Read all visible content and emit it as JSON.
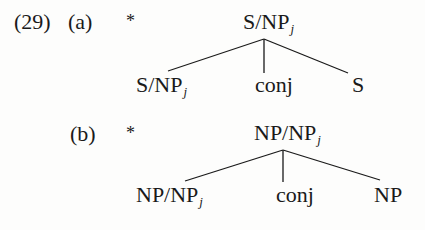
{
  "example_number": "(29)",
  "examples": [
    {
      "label": "(a)",
      "marker": "*",
      "root": {
        "base": "S/NP",
        "sub": "j"
      },
      "children": [
        {
          "base": "S/NP",
          "sub": "j"
        },
        {
          "base": "conj",
          "sub": ""
        },
        {
          "base": "S",
          "sub": ""
        }
      ]
    },
    {
      "label": "(b)",
      "marker": "*",
      "root": {
        "base": "NP/NP",
        "sub": "j"
      },
      "children": [
        {
          "base": "NP/NP",
          "sub": "j"
        },
        {
          "base": "conj",
          "sub": ""
        },
        {
          "base": "NP",
          "sub": ""
        }
      ]
    }
  ]
}
